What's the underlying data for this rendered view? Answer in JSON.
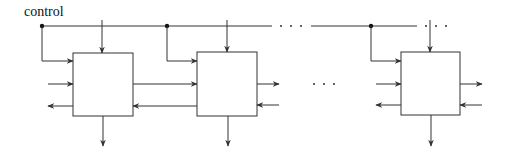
{
  "diagram": {
    "control_label": "control",
    "bus_y": 26,
    "colors": {
      "stroke": "#333333",
      "background": "#ffffff",
      "text": "#111111"
    },
    "blocks": [
      {
        "id": "block-1",
        "x": 73,
        "y": 53,
        "w": 60,
        "h": 63,
        "tap_x": 42,
        "top_in_x": 102
      },
      {
        "id": "block-2",
        "x": 197,
        "y": 52,
        "w": 60,
        "h": 64,
        "tap_x": 167,
        "top_in_x": 227
      },
      {
        "id": "block-3",
        "x": 401,
        "y": 52,
        "w": 59,
        "h": 63,
        "tap_x": 371,
        "top_in_x": 430
      }
    ],
    "ellipses": [
      {
        "location": "bus",
        "dots_x": [
          281,
          291,
          301
        ],
        "y": 26
      },
      {
        "location": "bus-end",
        "dots_x": [
          426,
          436,
          446
        ],
        "y": 26
      },
      {
        "location": "between-blocks",
        "dots_x": [
          314,
          324,
          334
        ],
        "y": 84
      }
    ],
    "ports": {
      "control_in": "left, from bus tap",
      "data_in_left": "left, middle",
      "data_out_left": "left, bottom",
      "data_out_right": "right, middle",
      "data_in_right": "right, bottom",
      "control_top": "top, from bus",
      "output_bottom": "bottom"
    }
  }
}
